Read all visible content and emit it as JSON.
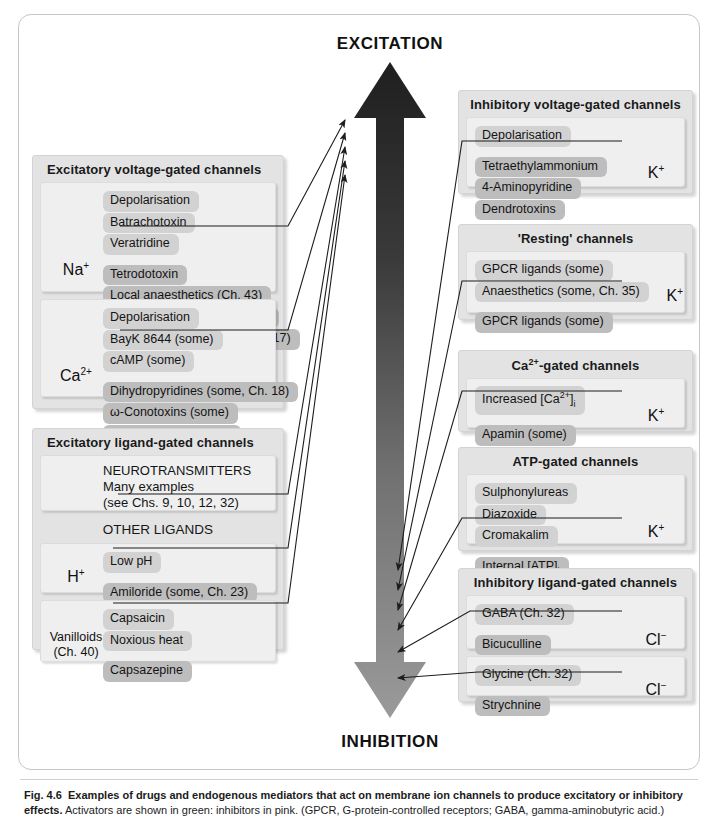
{
  "figure": {
    "arrow_top_label": "EXCITATION",
    "arrow_bottom_label": "INHIBITION",
    "arrow_colors": {
      "top": "#262626",
      "bottom": "#8c8c8c"
    },
    "activator_color": "#d2d2d2",
    "inhibitor_color": "#bdbdbd",
    "caption_label": "Fig. 4.6",
    "caption_bold": "Examples of drugs and endogenous mediators that act on membrane ion channels to produce excitatory or inhibitory effects.",
    "caption_rest": "Activators are shown in green: inhibitors in pink. (GPCR, G-protein-controlled receptors; GABA, gamma-aminobutyric acid.)"
  },
  "left_panels": [
    {
      "title": "Excitatory voltage-gated channels",
      "groups": [
        {
          "ion": "Na",
          "ion_sup": "+",
          "activators": [
            "Depolarisation",
            "Batrachotoxin",
            "Veratridine"
          ],
          "inhibitors": [
            "Tetrodotoxin",
            "Local anaesthetics (Ch. 43)",
            "Antiepileptics (some, Ch. 39)",
            "Antidysrhythmics (some, Ch. 17)"
          ]
        },
        {
          "ion": "Ca",
          "ion_sup": "2+",
          "activators": [
            "Depolarisation",
            "BayK 8644 (some)",
            "cAMP (some)"
          ],
          "inhibitors": [
            "Dihydropyridines (some, Ch. 18)",
            "ω-Conotoxins (some)",
            "GPCR ligands (some)"
          ]
        }
      ]
    },
    {
      "title": "Excitatory ligand-gated channels",
      "groups": [
        {
          "ion": "",
          "ion_sup": "",
          "activators": [
            "NEUROTRANSMITTERS",
            "Many examples",
            "(see Chs. 9, 10, 12, 32)"
          ],
          "inhibitors": []
        }
      ],
      "subheading": "OTHER LIGANDS",
      "sub_groups": [
        {
          "ion": "H",
          "ion_sup": "+",
          "activators": [
            "Low pH"
          ],
          "inhibitors": [
            "Amiloride (some, Ch. 23)"
          ]
        },
        {
          "ion_lines": [
            "Vanilloids",
            "(Ch. 40)"
          ],
          "activators": [
            "Capsaicin",
            "Noxious heat"
          ],
          "inhibitors": [
            "Capsazepine"
          ]
        }
      ]
    }
  ],
  "right_panels": [
    {
      "title": "Inhibitory voltage-gated channels",
      "ion": "K",
      "ion_sup": "+",
      "activators": [
        "Depolarisation"
      ],
      "inhibitors": [
        "Tetraethylammonium",
        "4-Aminopyridine",
        "Dendrotoxins"
      ]
    },
    {
      "title": "'Resting' channels",
      "ion": "K",
      "ion_sup": "+",
      "activators": [
        "GPCR ligands (some)",
        "Anaesthetics (some, Ch. 35)"
      ],
      "inhibitors": [
        "GPCR ligands (some)"
      ]
    },
    {
      "title": "Ca2+-gated channels",
      "title_html": true,
      "ion": "K",
      "ion_sup": "+",
      "activators": [
        "Increased [Ca2+]i"
      ],
      "inhibitors": [
        "Apamin (some)"
      ]
    },
    {
      "title": "ATP-gated channels",
      "ion": "K",
      "ion_sup": "+",
      "activators": [
        "Sulphonylureas",
        "Diazoxide",
        "Cromakalim"
      ],
      "inhibitors": [
        "Internal [ATP]i"
      ]
    },
    {
      "title": "Inhibitory ligand-gated channels",
      "subpanels": [
        {
          "ion": "Cl",
          "ion_sup": "−",
          "activators": [
            "GABA (Ch. 32)"
          ],
          "inhibitors": [
            "Bicuculline",
            "Picrotoxin"
          ]
        },
        {
          "ion": "Cl",
          "ion_sup": "−",
          "activators": [
            "Glycine (Ch. 32)"
          ],
          "inhibitors": [
            "Strychnine"
          ]
        }
      ]
    }
  ]
}
